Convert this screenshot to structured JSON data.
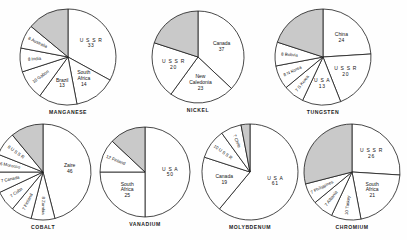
{
  "chart_data": [
    {
      "type": "pie",
      "title": "MANGANESE",
      "unit": "percent of world production",
      "slices": [
        {
          "label": "U S S R",
          "value": 33,
          "shaded": false,
          "label_style": "spaced"
        },
        {
          "label": "South Africa",
          "value": 14,
          "shaded": false
        },
        {
          "label": "Brazil",
          "value": 13,
          "shaded": false
        },
        {
          "label": "Gabon",
          "value": 10,
          "shaded": false,
          "label_style": "radial"
        },
        {
          "label": "India",
          "value": 8,
          "shaded": false,
          "label_style": "radial"
        },
        {
          "label": "Australia",
          "value": 8,
          "shaded": false,
          "label_style": "radial"
        },
        {
          "label": "",
          "value": 14,
          "shaded": true
        }
      ]
    },
    {
      "type": "pie",
      "title": "NICKEL",
      "unit": "percent of world production",
      "slices": [
        {
          "label": "Canada",
          "value": 37,
          "shaded": false
        },
        {
          "label": "New Caledonia",
          "value": 23,
          "shaded": false
        },
        {
          "label": "U S S R",
          "value": 20,
          "shaded": false,
          "label_style": "spaced"
        },
        {
          "label": "",
          "value": 20,
          "shaded": true
        }
      ]
    },
    {
      "type": "pie",
      "title": "TUNGSTEN",
      "unit": "percent of world production",
      "slices": [
        {
          "label": "China",
          "value": 24,
          "shaded": false
        },
        {
          "label": "U S S R",
          "value": 20,
          "shaded": false,
          "label_style": "spaced"
        },
        {
          "label": "U S A",
          "value": 13,
          "shaded": false,
          "label_style": "spaced"
        },
        {
          "label": "S Korea",
          "value": 7,
          "shaded": false,
          "label_style": "radial"
        },
        {
          "label": "N Korea",
          "value": 8,
          "shaded": false,
          "label_style": "radial"
        },
        {
          "label": "Bolivia",
          "value": 8,
          "shaded": false,
          "label_style": "radial"
        },
        {
          "label": "",
          "value": 20,
          "shaded": true
        }
      ]
    },
    {
      "type": "pie",
      "title": "COBALT",
      "unit": "percent of world production",
      "slices": [
        {
          "label": "Zaire",
          "value": 46,
          "shaded": false
        },
        {
          "label": "Zambia",
          "value": 8,
          "shaded": false,
          "label_style": "radial"
        },
        {
          "label": "Finland",
          "value": 7,
          "shaded": false,
          "label_style": "radial"
        },
        {
          "label": "Cuba",
          "value": 7,
          "shaded": false,
          "label_style": "radial"
        },
        {
          "label": "Canada",
          "value": 7,
          "shaded": false,
          "label_style": "radial"
        },
        {
          "label": "Morocco",
          "value": 6,
          "shaded": false,
          "label_style": "radial"
        },
        {
          "label": "U S S R",
          "value": 8,
          "shaded": false,
          "label_style": "radial"
        },
        {
          "label": "",
          "value": 11,
          "shaded": true
        }
      ]
    },
    {
      "type": "pie",
      "title": "VANADIUM",
      "unit": "percent of world production",
      "slices": [
        {
          "label": "U S A",
          "value": 50,
          "shaded": false,
          "label_style": "spaced"
        },
        {
          "label": "South Africa",
          "value": 25,
          "shaded": false
        },
        {
          "label": "Finland",
          "value": 12,
          "shaded": false,
          "label_style": "radial"
        },
        {
          "label": "",
          "value": 13,
          "shaded": true
        }
      ]
    },
    {
      "type": "pie",
      "title": "MOLYBDENUM",
      "unit": "percent of world production",
      "slices": [
        {
          "label": "U S A",
          "value": 61,
          "shaded": false,
          "label_style": "spaced"
        },
        {
          "label": "Canada",
          "value": 19,
          "shaded": false
        },
        {
          "label": "U S S R",
          "value": 10,
          "shaded": false,
          "label_style": "radial"
        },
        {
          "label": "Chile",
          "value": 7,
          "shaded": false,
          "label_style": "radial"
        },
        {
          "label": "",
          "value": 3,
          "shaded": true
        }
      ]
    },
    {
      "type": "pie",
      "title": "CHROMIUM",
      "unit": "percent of world production",
      "slices": [
        {
          "label": "U S S R",
          "value": 26,
          "shaded": false,
          "label_style": "spaced"
        },
        {
          "label": "South Africa",
          "value": 21,
          "shaded": false
        },
        {
          "label": "Turkey",
          "value": 10,
          "shaded": false,
          "label_style": "radial"
        },
        {
          "label": "Albania",
          "value": 7,
          "shaded": false,
          "label_style": "radial"
        },
        {
          "label": "Philippines",
          "value": 7,
          "shaded": false,
          "label_style": "radial"
        },
        {
          "label": "",
          "value": 29,
          "shaded": true
        }
      ]
    }
  ],
  "style": {
    "shaded_fill": "#c9c9c9",
    "plain_fill": "#ffffff",
    "stroke": "#1a1a1a"
  },
  "layout": {
    "rows": [
      {
        "charts": [
          {
            "index": 0,
            "cx": 68,
            "cy": 57,
            "r": 48,
            "start_angle": -90
          },
          {
            "index": 1,
            "cx": 198,
            "cy": 57,
            "r": 46,
            "start_angle": -90
          },
          {
            "index": 2,
            "cx": 323,
            "cy": 57,
            "r": 48,
            "start_angle": -90
          }
        ]
      },
      {
        "charts": [
          {
            "index": 3,
            "cx": 43,
            "cy": 172,
            "r": 48,
            "start_angle": -90
          },
          {
            "index": 4,
            "cx": 145,
            "cy": 172,
            "r": 45,
            "start_angle": -90
          },
          {
            "index": 5,
            "cx": 250,
            "cy": 172,
            "r": 48,
            "start_angle": -90
          },
          {
            "index": 6,
            "cx": 352,
            "cy": 172,
            "r": 48,
            "start_angle": -90
          }
        ]
      }
    ]
  }
}
